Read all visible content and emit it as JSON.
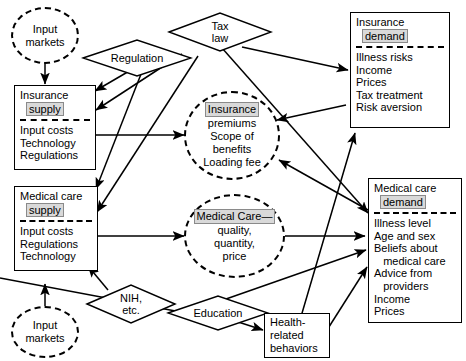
{
  "diagram": {
    "colors": {
      "stroke": "#000000",
      "background": "#ffffff",
      "highlight": "#d9d9d9"
    },
    "nodes": {
      "input_markets_top": {
        "label": "Input\nmarkets",
        "line1": "Input",
        "line2": "markets",
        "shape": "ellipse-dashed"
      },
      "input_markets_bottom": {
        "label": "Input\nmarkets",
        "line1": "Input",
        "line2": "markets",
        "shape": "ellipse-dashed"
      },
      "regulation": {
        "label": "Regulation",
        "shape": "diamond"
      },
      "tax_law": {
        "label": "Tax law",
        "line1": "Tax",
        "line2": "law",
        "shape": "diamond"
      },
      "nih": {
        "label": "NIH, etc.",
        "line1": "NIH,",
        "line2": "etc.",
        "shape": "diamond"
      },
      "education": {
        "label": "Education",
        "shape": "diamond"
      },
      "insurance_supply": {
        "shape": "rect",
        "title_line1": "Insurance",
        "title_line2": "supply",
        "items": [
          "Input costs",
          "Technology",
          "Regulations"
        ]
      },
      "medical_care_supply": {
        "shape": "rect",
        "title_line1": "Medical care",
        "title_line2": "supply",
        "items": [
          "Input costs",
          "Regulations",
          "Technology"
        ]
      },
      "insurance_demand": {
        "shape": "rect",
        "title_line1": "Insurance",
        "title_line2": "demand",
        "items": [
          "Illness risks",
          "Income",
          "Prices",
          "Tax treatment",
          "Risk aversion"
        ]
      },
      "medical_care_demand": {
        "shape": "rect",
        "title_line1": "Medical care",
        "title_line2": "demand",
        "items": [
          "Illness level",
          "Age and sex",
          "Beliefs about",
          "   medical care",
          "Advice from",
          "   providers",
          "Income",
          "Prices"
        ]
      },
      "insurance_market": {
        "shape": "ellipse-dashed",
        "line1": "Insurance",
        "line2": "premiums",
        "line3": "Scope of",
        "line4": "benefits",
        "line5": "Loading fee"
      },
      "medical_care_market": {
        "shape": "ellipse-dashed",
        "line1": "Medical Care—",
        "line2": "quality,",
        "line3": "quantity,",
        "line4": "price"
      },
      "health_behaviors": {
        "shape": "rect-plain",
        "line1": "Health-",
        "line2": "related",
        "line3": "behaviors"
      }
    },
    "edges": [
      {
        "from": "input_markets_top",
        "to": "insurance_supply",
        "style": "solid",
        "arrow": "single"
      },
      {
        "from": "input_markets_bottom",
        "to": "medical_care_supply",
        "style": "solid",
        "arrow": "single"
      },
      {
        "from": "regulation",
        "to": "insurance_supply",
        "style": "solid",
        "arrow": "single"
      },
      {
        "from": "regulation",
        "to": "medical_care_supply",
        "style": "solid",
        "arrow": "single"
      },
      {
        "from": "tax_law",
        "to": "insurance_supply",
        "style": "solid",
        "arrow": "single"
      },
      {
        "from": "tax_law",
        "to": "medical_care_supply",
        "style": "solid",
        "arrow": "single"
      },
      {
        "from": "tax_law",
        "to": "insurance_demand",
        "style": "solid",
        "arrow": "single"
      },
      {
        "from": "insurance_supply",
        "to": "insurance_market",
        "style": "solid",
        "arrow": "double"
      },
      {
        "from": "insurance_demand",
        "to": "insurance_market",
        "style": "solid",
        "arrow": "single"
      },
      {
        "from": "medical_care_supply",
        "to": "medical_care_market",
        "style": "solid",
        "arrow": "double"
      },
      {
        "from": "medical_care_demand",
        "to": "medical_care_market",
        "style": "solid",
        "arrow": "double"
      },
      {
        "from": "medical_care_demand",
        "to": "insurance_market",
        "style": "solid",
        "arrow": "single"
      },
      {
        "from": "nih",
        "to": "medical_care_supply",
        "style": "solid",
        "arrow": "single"
      },
      {
        "from": "education",
        "to": "health_behaviors",
        "style": "solid",
        "arrow": "single"
      },
      {
        "from": "education",
        "to": "medical_care_demand",
        "style": "solid",
        "arrow": "single"
      },
      {
        "from": "health_behaviors",
        "to": "insurance_demand",
        "style": "solid",
        "arrow": "single"
      },
      {
        "from": "health_behaviors",
        "to": "medical_care_demand",
        "style": "solid",
        "arrow": "single"
      }
    ]
  }
}
